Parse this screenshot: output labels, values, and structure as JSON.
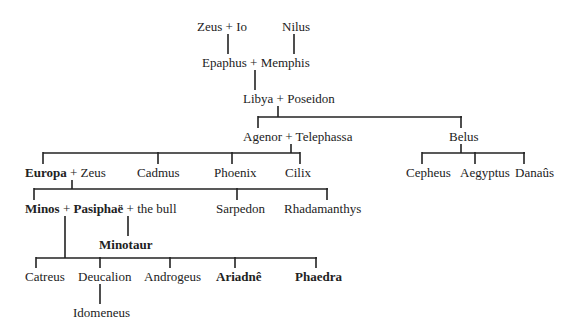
{
  "diagram": {
    "type": "family-tree",
    "nodes": {
      "zeus_io": {
        "parts": [
          "Zeus",
          "+",
          "Io"
        ]
      },
      "nilus": {
        "label": "Nilus"
      },
      "epaphus_memphis": {
        "parts": [
          "Epaphus",
          "+",
          "Memphis"
        ]
      },
      "libya_poseidon": {
        "parts": [
          "Libya",
          "+",
          "Poseidon"
        ]
      },
      "agenor_telephassa": {
        "parts": [
          "Agenor",
          "+",
          "Telephassa"
        ]
      },
      "belus": {
        "label": "Belus"
      },
      "europa_zeus": {
        "parts": [
          "Europa",
          "+",
          "Zeus"
        ],
        "bold": [
          "Europa"
        ]
      },
      "cadmus": {
        "label": "Cadmus"
      },
      "phoenix": {
        "label": "Phoenix"
      },
      "cilix": {
        "label": "Cilix"
      },
      "cepheus": {
        "label": "Cepheus"
      },
      "aegyptus": {
        "label": "Aegyptus"
      },
      "danaus": {
        "label": "Danaûs"
      },
      "minos_pasiphae_bull": {
        "parts": [
          "Minos",
          "+",
          "Pasiphaë",
          "+",
          "the bull"
        ],
        "bold": [
          "Minos",
          "Pasiphaë"
        ]
      },
      "sarpedon": {
        "label": "Sarpedon"
      },
      "rhadamanthys": {
        "label": "Rhadamanthys"
      },
      "minotaur": {
        "label": "Minotaur",
        "bold": true
      },
      "catreus": {
        "label": "Catreus"
      },
      "deucalion": {
        "label": "Deucalion"
      },
      "androgeus": {
        "label": "Androgeus"
      },
      "ariadne": {
        "label": "Ariadnê",
        "bold": true
      },
      "phaedra": {
        "label": "Phaedra",
        "bold": true
      },
      "idomeneus": {
        "label": "Idomeneus"
      }
    },
    "edges": [
      [
        "zeus_io",
        "epaphus_memphis"
      ],
      [
        "nilus",
        "epaphus_memphis"
      ],
      [
        "epaphus_memphis",
        "libya_poseidon"
      ],
      [
        "libya_poseidon",
        "agenor_telephassa"
      ],
      [
        "libya_poseidon",
        "belus"
      ],
      [
        "agenor_telephassa",
        "europa_zeus"
      ],
      [
        "agenor_telephassa",
        "cadmus"
      ],
      [
        "agenor_telephassa",
        "phoenix"
      ],
      [
        "agenor_telephassa",
        "cilix"
      ],
      [
        "belus",
        "cepheus"
      ],
      [
        "belus",
        "aegyptus"
      ],
      [
        "belus",
        "danaus"
      ],
      [
        "europa_zeus",
        "minos_pasiphae_bull"
      ],
      [
        "europa_zeus",
        "sarpedon"
      ],
      [
        "europa_zeus",
        "rhadamanthys"
      ],
      [
        "minos_pasiphae_bull",
        "minotaur"
      ],
      [
        "minos_pasiphae_bull",
        "catreus"
      ],
      [
        "minos_pasiphae_bull",
        "deucalion"
      ],
      [
        "minos_pasiphae_bull",
        "androgeus"
      ],
      [
        "minos_pasiphae_bull",
        "ariadne"
      ],
      [
        "minos_pasiphae_bull",
        "phaedra"
      ],
      [
        "deucalion",
        "idomeneus"
      ]
    ]
  }
}
